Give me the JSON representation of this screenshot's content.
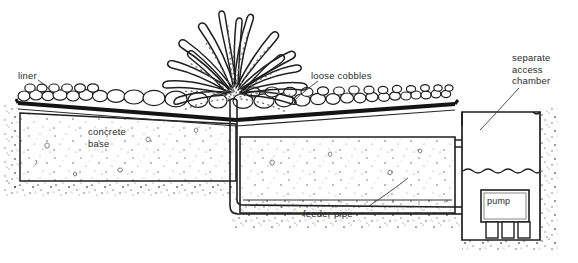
{
  "diagram": {
    "type": "technical-cross-section",
    "background_color": "#ffffff",
    "ink_color": "#222222",
    "labels": {
      "liner": "liner",
      "loose_cobbles": "loose cobbles",
      "separate_access_chamber": "separate\naccess\nchamber",
      "concrete_base": "concrete\nbase",
      "feeder_pipe": "feeder pipe",
      "pump": "pump"
    },
    "components": [
      {
        "name": "fountain-spray",
        "label": ""
      },
      {
        "name": "liner",
        "label": "liner"
      },
      {
        "name": "loose-cobbles",
        "label": "loose cobbles"
      },
      {
        "name": "concrete-base",
        "label": "concrete base"
      },
      {
        "name": "reservoir",
        "label": ""
      },
      {
        "name": "feeder-pipe",
        "label": "feeder pipe"
      },
      {
        "name": "riser-pipe",
        "label": ""
      },
      {
        "name": "access-chamber",
        "label": "separate access chamber"
      },
      {
        "name": "pump",
        "label": "pump"
      },
      {
        "name": "water-level",
        "label": ""
      },
      {
        "name": "soil",
        "label": ""
      }
    ]
  }
}
